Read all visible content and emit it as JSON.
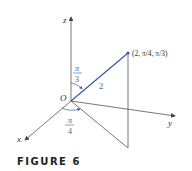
{
  "figure": {
    "caption": "FIGURE 6",
    "axes": {
      "x": "x",
      "y": "y",
      "z": "z"
    },
    "origin_label": "O",
    "point_label": "(2, π/4, π/3)",
    "radius_label": "2",
    "phi_label": {
      "num": "π",
      "den": "3"
    },
    "theta_label": {
      "num": "π",
      "den": "4"
    },
    "colors": {
      "axes": "#555555",
      "accent": "#3a5ea8"
    }
  }
}
